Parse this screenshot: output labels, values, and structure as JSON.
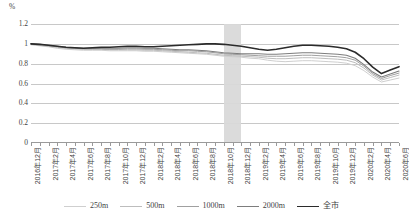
{
  "chart_data": {
    "type": "line",
    "title": "",
    "xlabel": "",
    "ylabel": "%",
    "unit_label": "%",
    "ylim": [
      0,
      1.2
    ],
    "ytick_labels": [
      "1.2",
      "1",
      "0.8",
      "0.6",
      "0.4",
      "0.2",
      "0"
    ],
    "ytick_values": [
      1.2,
      1.0,
      0.8,
      0.6,
      0.4,
      0.2,
      0
    ],
    "grid": true,
    "legend_position": "bottom",
    "highlight_band": {
      "start": "2018年10月",
      "end": "2018年12月",
      "color": "#d9d9d9"
    },
    "x": [
      "2016年12月",
      "2017年1月",
      "2017年2月",
      "2017年3月",
      "2017年4月",
      "2017年5月",
      "2017年6月",
      "2017年7月",
      "2017年8月",
      "2017年9月",
      "2017年10月",
      "2017年11月",
      "2017年12月",
      "2018年1月",
      "2018年2月",
      "2018年3月",
      "2018年4月",
      "2018年5月",
      "2018年6月",
      "2018年7月",
      "2018年8月",
      "2018年9月",
      "2018年10月",
      "2018年11月",
      "2018年12月",
      "2019年1月",
      "2019年2月",
      "2019年3月",
      "2019年4月",
      "2019年5月",
      "2019年6月",
      "2019年7月",
      "2019年8月",
      "2019年9月",
      "2019年10月",
      "2019年11月",
      "2019年12月",
      "2020年1月",
      "2020年2月",
      "2020年3月",
      "2020年4月",
      "2020年5月",
      "2020年6月"
    ],
    "xtick_labels": [
      "2016年12月",
      "2017年2月",
      "2017年4月",
      "2017年6月",
      "2017年8月",
      "2017年10月",
      "2017年12月",
      "2018年2月",
      "2018年4月",
      "2018年6月",
      "2018年8月",
      "2018年10月",
      "2018年12月",
      "2019年2月",
      "2019年4月",
      "2019年6月",
      "2019年8月",
      "2019年10月",
      "2019年12月",
      "2020年2月",
      "2020年4月",
      "2020年6月"
    ],
    "xtick_step": 2,
    "series": [
      {
        "name": "250m",
        "color": "#cfcfcf",
        "width": 1.0,
        "values": [
          0.99,
          0.98,
          0.97,
          0.955,
          0.945,
          0.94,
          0.935,
          0.935,
          0.935,
          0.93,
          0.93,
          0.93,
          0.93,
          0.925,
          0.925,
          0.92,
          0.915,
          0.91,
          0.905,
          0.9,
          0.895,
          0.885,
          0.875,
          0.87,
          0.865,
          0.855,
          0.85,
          0.835,
          0.825,
          0.82,
          0.825,
          0.83,
          0.83,
          0.825,
          0.82,
          0.815,
          0.805,
          0.78,
          0.73,
          0.665,
          0.615,
          0.635,
          0.655
        ]
      },
      {
        "name": "500m",
        "color": "#bdbdbd",
        "width": 1.0,
        "values": [
          0.995,
          0.985,
          0.975,
          0.965,
          0.955,
          0.95,
          0.945,
          0.945,
          0.945,
          0.94,
          0.94,
          0.94,
          0.94,
          0.935,
          0.935,
          0.93,
          0.925,
          0.92,
          0.915,
          0.91,
          0.905,
          0.895,
          0.885,
          0.88,
          0.875,
          0.87,
          0.865,
          0.855,
          0.85,
          0.85,
          0.855,
          0.86,
          0.86,
          0.855,
          0.85,
          0.845,
          0.835,
          0.81,
          0.755,
          0.685,
          0.635,
          0.66,
          0.685
        ]
      },
      {
        "name": "1000m",
        "color": "#a0a0a0",
        "width": 1.0,
        "values": [
          1.0,
          0.99,
          0.98,
          0.97,
          0.96,
          0.955,
          0.95,
          0.95,
          0.95,
          0.945,
          0.945,
          0.95,
          0.95,
          0.945,
          0.945,
          0.94,
          0.935,
          0.93,
          0.93,
          0.925,
          0.92,
          0.91,
          0.9,
          0.895,
          0.89,
          0.885,
          0.88,
          0.875,
          0.875,
          0.875,
          0.88,
          0.885,
          0.885,
          0.88,
          0.875,
          0.87,
          0.86,
          0.835,
          0.775,
          0.7,
          0.65,
          0.68,
          0.705
        ]
      },
      {
        "name": "2000m",
        "color": "#7d7d7d",
        "width": 1.1,
        "values": [
          1.0,
          0.995,
          0.985,
          0.975,
          0.965,
          0.96,
          0.955,
          0.955,
          0.955,
          0.955,
          0.955,
          0.96,
          0.96,
          0.955,
          0.955,
          0.95,
          0.945,
          0.94,
          0.94,
          0.935,
          0.93,
          0.92,
          0.91,
          0.905,
          0.9,
          0.9,
          0.9,
          0.895,
          0.895,
          0.9,
          0.905,
          0.91,
          0.91,
          0.905,
          0.9,
          0.895,
          0.885,
          0.855,
          0.79,
          0.715,
          0.665,
          0.695,
          0.725
        ]
      },
      {
        "name": "全市",
        "color": "#2b2b2b",
        "width": 1.6,
        "values": [
          1.0,
          0.995,
          0.985,
          0.975,
          0.965,
          0.96,
          0.955,
          0.96,
          0.965,
          0.965,
          0.97,
          0.975,
          0.975,
          0.97,
          0.97,
          0.975,
          0.98,
          0.985,
          0.99,
          0.995,
          1.0,
          1.0,
          0.995,
          0.985,
          0.975,
          0.96,
          0.945,
          0.935,
          0.945,
          0.96,
          0.975,
          0.985,
          0.985,
          0.98,
          0.975,
          0.965,
          0.95,
          0.915,
          0.85,
          0.765,
          0.7,
          0.735,
          0.77
        ]
      }
    ]
  },
  "legend": {
    "items": [
      {
        "label": "250m"
      },
      {
        "label": "500m"
      },
      {
        "label": "1000m"
      },
      {
        "label": "2000m"
      },
      {
        "label": "全市"
      }
    ]
  }
}
